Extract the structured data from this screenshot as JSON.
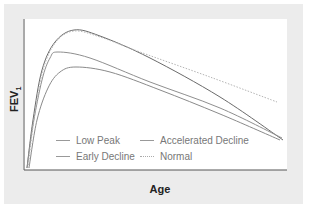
{
  "chart_data": {
    "type": "line",
    "title": "",
    "xlabel": "Age",
    "ylabel": "FEV1",
    "ylabel_main": "FEV",
    "ylabel_sub": "1",
    "grid": false,
    "legend_position": "lower-left inside",
    "x_ticks": [],
    "y_ticks": [],
    "series": [
      {
        "name": "Low Peak",
        "style": "solid",
        "color": "#8a8a8a",
        "points": [
          [
            29,
            168
          ],
          [
            37,
            120
          ],
          [
            48,
            88
          ],
          [
            60,
            72
          ],
          [
            76,
            67
          ],
          [
            110,
            72
          ],
          [
            160,
            90
          ],
          [
            220,
            114
          ],
          [
            280,
            140
          ]
        ]
      },
      {
        "name": "Accelerated Decline",
        "style": "solid",
        "color": "#6a6a6a",
        "points": [
          [
            27,
            168
          ],
          [
            33,
            120
          ],
          [
            42,
            70
          ],
          [
            55,
            42
          ],
          [
            74,
            30
          ],
          [
            100,
            36
          ],
          [
            150,
            58
          ],
          [
            220,
            97
          ],
          [
            283,
            140
          ]
        ]
      },
      {
        "name": "Early Decline",
        "style": "solid",
        "color": "#8f8f8f",
        "points": [
          [
            27,
            168
          ],
          [
            33,
            125
          ],
          [
            42,
            80
          ],
          [
            50,
            58
          ],
          [
            58,
            52
          ],
          [
            90,
            58
          ],
          [
            150,
            82
          ],
          [
            220,
            108
          ],
          [
            282,
            138
          ]
        ]
      },
      {
        "name": "Normal",
        "style": "dotted",
        "color": "#b5b5b5",
        "points": [
          [
            28,
            168
          ],
          [
            34,
            120
          ],
          [
            43,
            70
          ],
          [
            56,
            42
          ],
          [
            74,
            31
          ],
          [
            100,
            37
          ],
          [
            140,
            52
          ],
          [
            210,
            77
          ],
          [
            277,
            102
          ]
        ]
      }
    ]
  },
  "legend": {
    "items": [
      {
        "label": "Low Peak",
        "style": "solid"
      },
      {
        "label": "Accelerated Decline",
        "style": "solid"
      },
      {
        "label": "Early Decline",
        "style": "solid"
      },
      {
        "label": "Normal",
        "style": "dotted"
      }
    ]
  },
  "axes": {
    "x_label": "Age",
    "y_label_main": "FEV",
    "y_label_sub": "1"
  },
  "colors": {
    "panel_background": "#ececec",
    "plot_background": "#ffffff",
    "axis": "#555555"
  }
}
